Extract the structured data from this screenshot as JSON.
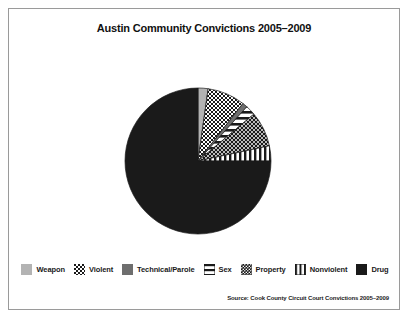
{
  "figure": {
    "title": "Austin Community Convictions 2005–2009",
    "source_note": "Source: Cook County Circuit Court Convictions 2005–2009",
    "frame_color": "#9a9a9a",
    "background": "#ffffff"
  },
  "chart_data": {
    "type": "pie",
    "title": "Austin Community Convictions 2005–2009",
    "xlabel": "",
    "ylabel": "",
    "legend_position": "bottom",
    "grid": false,
    "start_angle_deg": 0,
    "direction": "clockwise",
    "categories": [
      "Weapon",
      "Violent",
      "Technical/Parole",
      "Sex",
      "Property",
      "Nonviolent",
      "Drug"
    ],
    "values": [
      2.2,
      8.3,
      1.1,
      2.2,
      7.8,
      3.4,
      75.0
    ],
    "units": "percent",
    "slices": [
      {
        "label": "Weapon",
        "value": 2.2,
        "start_deg": 0.0,
        "end_deg": 8.0,
        "fill": "light-gray-solid",
        "color": "#b3b3b3"
      },
      {
        "label": "Violent",
        "value": 8.3,
        "start_deg": 8.0,
        "end_deg": 38.0,
        "fill": "checkerboard",
        "color": "#1a1a1a"
      },
      {
        "label": "Technical/Parole",
        "value": 1.1,
        "start_deg": 38.0,
        "end_deg": 42.0,
        "fill": "medium-gray-solid",
        "color": "#6e6e6e"
      },
      {
        "label": "Sex",
        "value": 2.2,
        "start_deg": 42.0,
        "end_deg": 50.0,
        "fill": "horizontal-lines",
        "color": "#1a1a1a"
      },
      {
        "label": "Property",
        "value": 7.8,
        "start_deg": 50.0,
        "end_deg": 78.0,
        "fill": "fine-dots",
        "color": "#1a1a1a"
      },
      {
        "label": "Nonviolent",
        "value": 3.4,
        "start_deg": 78.0,
        "end_deg": 90.0,
        "fill": "vertical-lines",
        "color": "#1a1a1a"
      },
      {
        "label": "Drug",
        "value": 75.0,
        "start_deg": 90.0,
        "end_deg": 360.0,
        "fill": "black-solid",
        "color": "#1a1a1a"
      }
    ]
  },
  "legend": {
    "items": [
      {
        "label": "Weapon",
        "swatch": "light-gray-solid"
      },
      {
        "label": "Violent",
        "swatch": "checkerboard"
      },
      {
        "label": "Technical/Parole",
        "swatch": "medium-gray-solid"
      },
      {
        "label": "Sex",
        "swatch": "horizontal-lines"
      },
      {
        "label": "Property",
        "swatch": "fine-dots"
      },
      {
        "label": "Nonviolent",
        "swatch": "vertical-lines"
      },
      {
        "label": "Drug",
        "swatch": "black-solid"
      }
    ]
  }
}
